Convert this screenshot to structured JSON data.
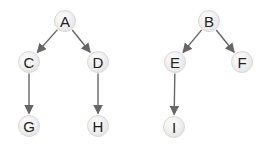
{
  "diagram": {
    "type": "forest",
    "nodes": [
      {
        "id": "A",
        "label": "A",
        "x": 65,
        "y": 21
      },
      {
        "id": "C",
        "label": "C",
        "x": 29,
        "y": 62
      },
      {
        "id": "D",
        "label": "D",
        "x": 98,
        "y": 62
      },
      {
        "id": "G",
        "label": "G",
        "x": 29,
        "y": 126
      },
      {
        "id": "H",
        "label": "H",
        "x": 98,
        "y": 126
      },
      {
        "id": "B",
        "label": "B",
        "x": 209,
        "y": 21
      },
      {
        "id": "E",
        "label": "E",
        "x": 175,
        "y": 62
      },
      {
        "id": "F",
        "label": "F",
        "x": 242,
        "y": 62
      },
      {
        "id": "I",
        "label": "I",
        "x": 174,
        "y": 127
      }
    ],
    "edges": [
      {
        "from": "A",
        "to": "C"
      },
      {
        "from": "A",
        "to": "D"
      },
      {
        "from": "C",
        "to": "G"
      },
      {
        "from": "D",
        "to": "H"
      },
      {
        "from": "B",
        "to": "E"
      },
      {
        "from": "B",
        "to": "F"
      },
      {
        "from": "E",
        "to": "I"
      }
    ],
    "colors": {
      "edge": "#666666",
      "node_fill": "#f2f2f2",
      "node_stroke": "#d8d8d8",
      "label": "#222222"
    }
  }
}
